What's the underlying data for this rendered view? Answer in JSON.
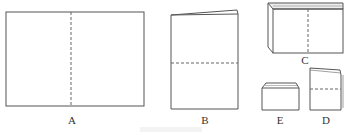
{
  "figure": {
    "type": "paper-folding-diagram",
    "panels": [
      {
        "id": "A",
        "label": "A",
        "description": "flat unfolded sheet with vertical dashed fold line"
      },
      {
        "id": "B",
        "label": "B",
        "description": "sheet folded once, with horizontal dashed fold line"
      },
      {
        "id": "C",
        "label": "C",
        "description": "folded stack viewed in perspective, with vertical dashed fold line"
      },
      {
        "id": "D",
        "label": "D",
        "description": "folded booklet with horizontal dashed fold line"
      },
      {
        "id": "E",
        "label": "E",
        "description": "final small folded booklet"
      }
    ],
    "caption": "",
    "colors": {
      "line": "#555555",
      "dash": "#666666",
      "label": "#333333"
    }
  }
}
